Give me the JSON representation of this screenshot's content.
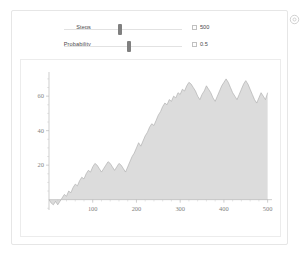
{
  "window": {
    "gear_icon": "gear-icon"
  },
  "controls": [
    {
      "label": "Steps",
      "value": "500",
      "thumb_fraction": 0.47,
      "stepper_icon": "stepper-box-icon"
    },
    {
      "label": "Probability",
      "value": "0.5",
      "thumb_fraction": 0.55,
      "stepper_icon": "stepper-box-icon"
    }
  ],
  "chart_data": {
    "type": "area",
    "title": "",
    "xlabel": "",
    "ylabel": "",
    "xlim": [
      0,
      510
    ],
    "ylim": [
      -6,
      74
    ],
    "xticks": [
      100,
      200,
      300,
      400,
      500
    ],
    "yticks": [
      20,
      40,
      60
    ],
    "grid": false,
    "legend": null,
    "fill_color": "#dcdcdc",
    "line_color": "#a8a8a8",
    "series": [
      {
        "name": "random walk",
        "x": [
          0,
          5,
          10,
          15,
          20,
          25,
          30,
          35,
          40,
          45,
          50,
          55,
          60,
          65,
          70,
          75,
          80,
          85,
          90,
          95,
          100,
          105,
          110,
          115,
          120,
          125,
          130,
          135,
          140,
          145,
          150,
          155,
          160,
          165,
          170,
          175,
          180,
          185,
          190,
          195,
          200,
          205,
          210,
          215,
          220,
          225,
          230,
          235,
          240,
          245,
          250,
          255,
          260,
          265,
          270,
          275,
          280,
          285,
          290,
          295,
          300,
          305,
          310,
          315,
          320,
          325,
          330,
          335,
          340,
          345,
          350,
          355,
          360,
          365,
          370,
          375,
          380,
          385,
          390,
          395,
          400,
          405,
          410,
          415,
          420,
          425,
          430,
          435,
          440,
          445,
          450,
          455,
          460,
          465,
          470,
          475,
          480,
          485,
          490,
          495,
          500
        ],
        "y": [
          0,
          -2,
          -3,
          -1,
          -3,
          -1,
          1,
          3,
          2,
          5,
          4,
          7,
          9,
          8,
          11,
          13,
          12,
          15,
          17,
          16,
          19,
          21,
          20,
          18,
          16,
          18,
          20,
          22,
          21,
          19,
          17,
          19,
          21,
          20,
          18,
          16,
          19,
          22,
          25,
          27,
          30,
          33,
          31,
          34,
          37,
          39,
          42,
          44,
          43,
          46,
          49,
          51,
          54,
          56,
          55,
          58,
          57,
          60,
          59,
          62,
          61,
          64,
          63,
          66,
          68,
          67,
          65,
          63,
          60,
          58,
          61,
          63,
          66,
          64,
          62,
          59,
          57,
          60,
          63,
          66,
          68,
          70,
          68,
          65,
          62,
          60,
          58,
          61,
          64,
          67,
          69,
          67,
          64,
          61,
          58,
          56,
          59,
          62,
          60,
          58,
          62
        ]
      }
    ]
  }
}
